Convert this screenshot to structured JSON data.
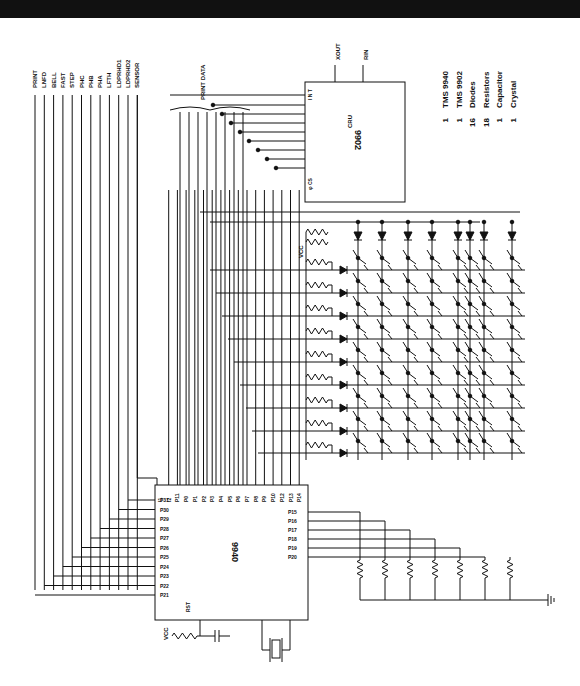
{
  "signals": [
    "PRINT",
    "LNFD",
    "BELL",
    "FAST",
    "STEP",
    "PHC",
    "PHB",
    "PHA",
    "LFTH",
    "LDPRHD1",
    "LDPRHD2",
    "SENSOR"
  ],
  "bus_label": "PRINT DATA",
  "chip_9902": {
    "name": "9902",
    "int_label": "I N T",
    "cru_label": "CRU",
    "cs_label": "φ CS",
    "xout": "XOUT",
    "rin": "RIN"
  },
  "chip_9940": {
    "name": "9940",
    "top_pins": [
      "I1",
      "I2",
      "P11",
      "P0",
      "P1",
      "P2",
      "P3",
      "P4",
      "P5",
      "P6",
      "P7",
      "P8",
      "P9",
      "P10",
      "P12",
      "P13",
      "P14"
    ],
    "left_pins": [
      "P31",
      "P30",
      "P29",
      "P28",
      "P27",
      "P26",
      "P25",
      "P24",
      "P23",
      "P22",
      "P21"
    ],
    "right_pins": [
      "P15",
      "P16",
      "P17",
      "P18",
      "P19",
      "P20"
    ],
    "rst": "RST"
  },
  "vcc_label": "VCC",
  "parts": [
    {
      "qty": "1",
      "name": "TMS 9940"
    },
    {
      "qty": "1",
      "name": "TMS 9902"
    },
    {
      "qty": "16",
      "name": "Diodes"
    },
    {
      "qty": "18",
      "name": "Resistors"
    },
    {
      "qty": "1",
      "name": "Capacitor"
    },
    {
      "qty": "1",
      "name": "Crystal"
    }
  ]
}
